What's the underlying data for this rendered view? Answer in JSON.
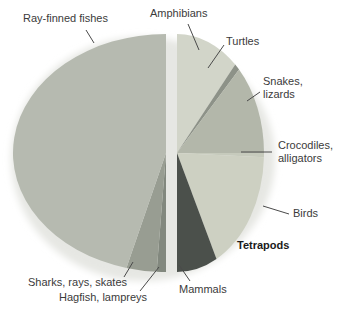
{
  "figure": {
    "background": "#ffffff",
    "text_color": "#3b3b3b"
  },
  "labels": {
    "ray_finned": "Ray-finned fishes",
    "amphibians": "Amphibians",
    "turtles": "Turtles",
    "snakes_lizards": "Snakes,\nlizards",
    "crocodiles_alligators": "Crocodiles,\nalligators",
    "birds": "Birds",
    "tetrapods": "Tetrapods",
    "mammals": "Mammals",
    "sharks": "Sharks, rays, skates",
    "hagfish": "Hagfish, lampreys"
  },
  "chart_data": {
    "type": "pie",
    "title": "",
    "layout": "exploded pie split into two half-discs separated by a vertical white gap; right half is labeled Tetrapods",
    "group_label": "Tetrapods",
    "slices": [
      {
        "id": "amphibians",
        "label": "Amphibians",
        "side": "right",
        "angle_deg": 42,
        "percent": 11.7,
        "color": "#d2d5c9"
      },
      {
        "id": "turtles",
        "label": "Turtles",
        "side": "right",
        "angle_deg": 3.5,
        "percent": 1.0,
        "color": "#8d9288"
      },
      {
        "id": "snakes",
        "label": "Snakes, lizards",
        "side": "right",
        "angle_deg": 44.5,
        "percent": 12.4,
        "color": "#b3b7aa"
      },
      {
        "id": "crocodiles",
        "label": "Crocodiles, alligators",
        "side": "right",
        "angle_deg": 2,
        "percent": 0.6,
        "color": "#c6cabc"
      },
      {
        "id": "birds",
        "label": "Birds",
        "side": "right",
        "angle_deg": 61,
        "percent": 16.9,
        "color": "#cdd0c2"
      },
      {
        "id": "mammals",
        "label": "Mammals",
        "side": "right",
        "angle_deg": 27,
        "percent": 7.5,
        "color": "#4b504b"
      },
      {
        "id": "hagfish",
        "label": "Hagfish, lampreys",
        "side": "left",
        "angle_deg": 3.5,
        "percent": 1.0,
        "color": "#82887e"
      },
      {
        "id": "sharks",
        "label": "Sharks, rays, skates",
        "side": "left",
        "angle_deg": 11.5,
        "percent": 3.2,
        "color": "#989d92"
      },
      {
        "id": "ray_finned",
        "label": "Ray-finned fishes",
        "side": "left",
        "angle_deg": 165,
        "percent": 45.8,
        "color": "#b6bab0"
      }
    ],
    "note": "No numeric values printed in figure; angles estimated from slice geometry"
  }
}
